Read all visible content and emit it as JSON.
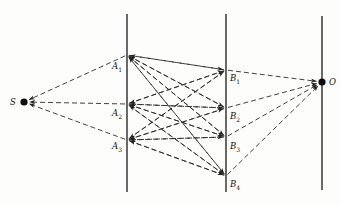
{
  "diagram": {
    "style": {
      "line_color": "#1a1a1a",
      "dash_color": "#2b2b2b",
      "background": "#fdfdfc",
      "dash_pattern": "5,3",
      "stroke_width": 0.9,
      "axis_stroke_width": 1.3
    },
    "axes": [
      {
        "name": "axis-a",
        "x": 127,
        "y1": 14,
        "y2": 192
      },
      {
        "name": "axis-b",
        "x": 226,
        "y1": 14,
        "y2": 192
      },
      {
        "name": "axis-o",
        "x": 322,
        "y1": 16,
        "y2": 190
      }
    ],
    "nodes": [
      {
        "id": "S",
        "label": "S",
        "sub": "",
        "x": 24,
        "y": 102,
        "dot": true,
        "label_x": 10,
        "label_y": 97,
        "role": "source"
      },
      {
        "id": "A1",
        "label": "A",
        "sub": "1",
        "x": 127,
        "y": 55,
        "dot": false,
        "label_x": 112,
        "label_y": 61,
        "role": "layer-a"
      },
      {
        "id": "A2",
        "label": "A",
        "sub": "2",
        "x": 127,
        "y": 104,
        "dot": false,
        "label_x": 112,
        "label_y": 108,
        "role": "layer-a"
      },
      {
        "id": "A3",
        "label": "A",
        "sub": "3",
        "x": 127,
        "y": 140,
        "dot": false,
        "label_x": 112,
        "label_y": 141,
        "role": "layer-a"
      },
      {
        "id": "B1",
        "label": "B",
        "sub": "1",
        "x": 226,
        "y": 70,
        "dot": false,
        "label_x": 230,
        "label_y": 73,
        "role": "layer-b"
      },
      {
        "id": "B2",
        "label": "B",
        "sub": "2",
        "x": 226,
        "y": 108,
        "dot": false,
        "label_x": 230,
        "label_y": 111,
        "role": "layer-b"
      },
      {
        "id": "B3",
        "label": "B",
        "sub": "3",
        "x": 226,
        "y": 137,
        "dot": false,
        "label_x": 230,
        "label_y": 141,
        "role": "layer-b"
      },
      {
        "id": "B4",
        "label": "B",
        "sub": "4",
        "x": 226,
        "y": 176,
        "dot": false,
        "label_x": 230,
        "label_y": 179,
        "role": "layer-b"
      },
      {
        "id": "O",
        "label": "O",
        "sub": "",
        "x": 322,
        "y": 82,
        "dot": true,
        "label_x": 329,
        "label_y": 77,
        "role": "sink"
      }
    ],
    "edges": [
      {
        "from": "A1",
        "to": "S",
        "arrow": true
      },
      {
        "from": "A2",
        "to": "S",
        "arrow": true
      },
      {
        "from": "A3",
        "to": "S",
        "arrow": true
      },
      {
        "from": "A1",
        "to": "B1",
        "arrow": true
      },
      {
        "from": "A1",
        "to": "B2",
        "arrow": true
      },
      {
        "from": "A1",
        "to": "B3",
        "arrow": true
      },
      {
        "from": "A1",
        "to": "B4",
        "arrow": true
      },
      {
        "from": "A2",
        "to": "B1",
        "arrow": true
      },
      {
        "from": "A2",
        "to": "B2",
        "arrow": true
      },
      {
        "from": "A2",
        "to": "B3",
        "arrow": true
      },
      {
        "from": "A2",
        "to": "B4",
        "arrow": true
      },
      {
        "from": "A3",
        "to": "B1",
        "arrow": true
      },
      {
        "from": "A3",
        "to": "B2",
        "arrow": true
      },
      {
        "from": "A3",
        "to": "B3",
        "arrow": true
      },
      {
        "from": "A3",
        "to": "B4",
        "arrow": true
      },
      {
        "from": "B1",
        "to": "A1",
        "arrow": true
      },
      {
        "from": "B2",
        "to": "A1",
        "arrow": true
      },
      {
        "from": "B3",
        "to": "A1",
        "arrow": true
      },
      {
        "from": "B4",
        "to": "A1",
        "arrow": true
      },
      {
        "from": "B1",
        "to": "A2",
        "arrow": true
      },
      {
        "from": "B2",
        "to": "A2",
        "arrow": true
      },
      {
        "from": "B3",
        "to": "A2",
        "arrow": true
      },
      {
        "from": "B4",
        "to": "A2",
        "arrow": true
      },
      {
        "from": "B1",
        "to": "A3",
        "arrow": true
      },
      {
        "from": "B2",
        "to": "A3",
        "arrow": true
      },
      {
        "from": "B3",
        "to": "A3",
        "arrow": true
      },
      {
        "from": "B4",
        "to": "A3",
        "arrow": true
      },
      {
        "from": "B1",
        "to": "O",
        "arrow": true
      },
      {
        "from": "B2",
        "to": "O",
        "arrow": true
      },
      {
        "from": "B3",
        "to": "O",
        "arrow": true
      },
      {
        "from": "B4",
        "to": "O",
        "arrow": true
      }
    ]
  }
}
